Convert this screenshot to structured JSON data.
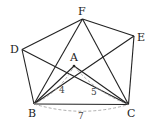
{
  "diagram": {
    "type": "geometry-figure",
    "points": {
      "A": {
        "label": "A",
        "x": 74,
        "y": 66,
        "label_x": 70,
        "label_y": 61
      },
      "B": {
        "label": "B",
        "x": 34,
        "y": 104,
        "label_x": 28,
        "label_y": 117
      },
      "C": {
        "label": "C",
        "x": 128.5,
        "y": 104.5,
        "label_x": 127,
        "label_y": 117
      },
      "D": {
        "label": "D",
        "x": 22,
        "y": 49.5,
        "label_x": 10,
        "label_y": 53
      },
      "E": {
        "label": "E",
        "x": 134,
        "y": 36,
        "label_x": 137,
        "label_y": 41
      },
      "F": {
        "label": "F",
        "x": 82.5,
        "y": 19,
        "label_x": 78,
        "label_y": 15
      }
    },
    "solid_segments": [
      [
        "D",
        "F"
      ],
      [
        "F",
        "E"
      ],
      [
        "E",
        "C"
      ],
      [
        "B",
        "C"
      ],
      [
        "D",
        "B"
      ],
      [
        "D",
        "C"
      ],
      [
        "F",
        "B"
      ],
      [
        "F",
        "C"
      ],
      [
        "E",
        "B"
      ],
      [
        "A",
        "B"
      ],
      [
        "A",
        "C"
      ]
    ],
    "dashed_arcs": [
      {
        "from": "B",
        "to": "A",
        "label": "4",
        "label_x": 59,
        "label_y": 93
      },
      {
        "from": "A",
        "to": "C",
        "label": "5",
        "label_x": 91,
        "label_y": 95
      },
      {
        "from": "B",
        "to": "C",
        "label": "7",
        "label_x": 78,
        "label_y": 119
      }
    ],
    "colors": {
      "line": "#222222",
      "dashed": "#999999",
      "text": "#222222"
    }
  }
}
